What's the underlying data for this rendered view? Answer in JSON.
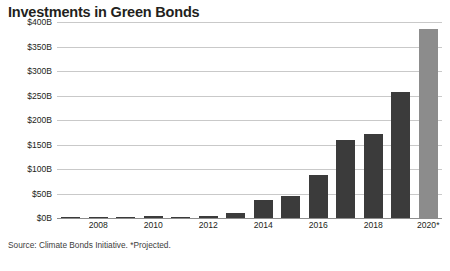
{
  "chart_data": {
    "type": "bar",
    "title": "Investments in Green Bonds",
    "xlabel": "",
    "ylabel": "",
    "ylim": [
      0,
      400
    ],
    "grid": true,
    "legend": "none",
    "unit": "USD billions",
    "categories": [
      "2007",
      "2008",
      "2009",
      "2010",
      "2011",
      "2012",
      "2013",
      "2014",
      "2015",
      "2016",
      "2017",
      "2018",
      "2019",
      "2020*"
    ],
    "tick_labels_x": [
      "2008",
      "2010",
      "2012",
      "2014",
      "2016",
      "2018",
      "2020*"
    ],
    "tick_labels_y": [
      "$0B",
      "$50B",
      "$100B",
      "$150B",
      "$200B",
      "$250B",
      "$300B",
      "$350B",
      "$400B"
    ],
    "tick_values_y": [
      0,
      50,
      100,
      150,
      200,
      250,
      300,
      350,
      400
    ],
    "values": [
      0.8,
      0.4,
      0.9,
      3.5,
      1.2,
      3.1,
      11,
      37,
      45,
      87,
      160,
      172,
      258,
      385
    ],
    "series": [
      {
        "name": "Green bond investments",
        "values": [
          0.8,
          0.4,
          0.9,
          3.5,
          1.2,
          3.1,
          11,
          37,
          45,
          87,
          160,
          172,
          258,
          385
        ]
      }
    ],
    "projected_categories": [
      "2020*"
    ],
    "annotations": [
      "*Projected."
    ],
    "source": "Source: Climate Bonds Initiative. *Projected.",
    "colors": {
      "bar": "#3b3b3b",
      "bar_projected": "#8c8c8c",
      "gridline": "#c9c9c9",
      "axis": "#8d8d8d",
      "text": "#231f20",
      "background": "#ffffff"
    }
  },
  "source_note": "Source: Climate Bonds Initiative. *Projected."
}
